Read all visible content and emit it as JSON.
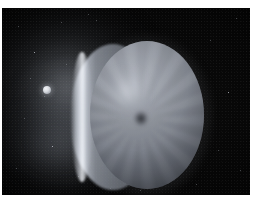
{
  "image": {
    "title": "Astronomical image of a gas giant planet with moon",
    "medium": "photographic print with white border",
    "width_px": 260,
    "height_px": 216
  },
  "frame": {
    "plate_color": "#040404",
    "paper_color": "#ffffff",
    "margin_top_px": 8,
    "margin_left_px": 2,
    "margin_right_px": 10,
    "margin_bottom_px": 21
  },
  "scene": {
    "background_label": "deep space background",
    "background_color": "#040404",
    "glow": {
      "label": "diffuse nebular glow",
      "position": "left of centre",
      "color": "#b4bac4"
    },
    "planet": {
      "label": "planetary disc",
      "center_x_px": 145,
      "center_y_px": 107,
      "diameter_px": 114,
      "body_color": "#8b9099",
      "highlight_color": "#a9aeb8",
      "shadow_color": "#3e424a",
      "features": [
        {
          "name": "bright-cloud-patch",
          "position": "upper-left quadrant",
          "color": "#d6dae2"
        },
        {
          "name": "radial-streak-pattern",
          "position": "whole disc",
          "color": "#6d727b"
        },
        {
          "name": "dark-polar-vortex",
          "position": "near centre",
          "color": "#1a1c21"
        }
      ]
    },
    "limb": {
      "label": "crescent limb arc",
      "position": "left edge of disc",
      "color": "#c4cad4"
    },
    "moon": {
      "label": "small moon",
      "center_x_px": 45,
      "center_y_px": 82,
      "diameter_px": 8,
      "color": "#f2f4f7"
    },
    "stars": [
      {
        "x": 18,
        "y": 26,
        "bright": false
      },
      {
        "x": 34,
        "y": 52,
        "bright": true
      },
      {
        "x": 61,
        "y": 22,
        "bright": false
      },
      {
        "x": 24,
        "y": 118,
        "bright": false
      },
      {
        "x": 52,
        "y": 146,
        "bright": true
      },
      {
        "x": 16,
        "y": 168,
        "bright": false
      },
      {
        "x": 78,
        "y": 176,
        "bright": false
      },
      {
        "x": 96,
        "y": 20,
        "bright": false
      },
      {
        "x": 210,
        "y": 40,
        "bright": false
      },
      {
        "x": 228,
        "y": 92,
        "bright": true
      },
      {
        "x": 218,
        "y": 150,
        "bright": false
      },
      {
        "x": 196,
        "y": 184,
        "bright": false
      },
      {
        "x": 140,
        "y": 190,
        "bright": false
      },
      {
        "x": 110,
        "y": 188,
        "bright": false
      },
      {
        "x": 44,
        "y": 96,
        "bright": false
      },
      {
        "x": 66,
        "y": 64,
        "bright": false
      },
      {
        "x": 30,
        "y": 78,
        "bright": false
      },
      {
        "x": 88,
        "y": 14,
        "bright": false
      },
      {
        "x": 236,
        "y": 18,
        "bright": false
      },
      {
        "x": 240,
        "y": 170,
        "bright": false
      }
    ]
  }
}
